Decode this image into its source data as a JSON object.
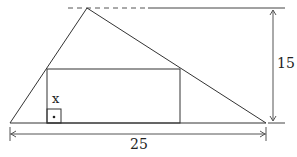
{
  "figure": {
    "labels": {
      "height_value": "15",
      "base_value": "25",
      "rect_height_var": "x"
    },
    "colors": {
      "stroke": "#333333",
      "dim_stroke": "#555555",
      "background": "#ffffff"
    }
  }
}
